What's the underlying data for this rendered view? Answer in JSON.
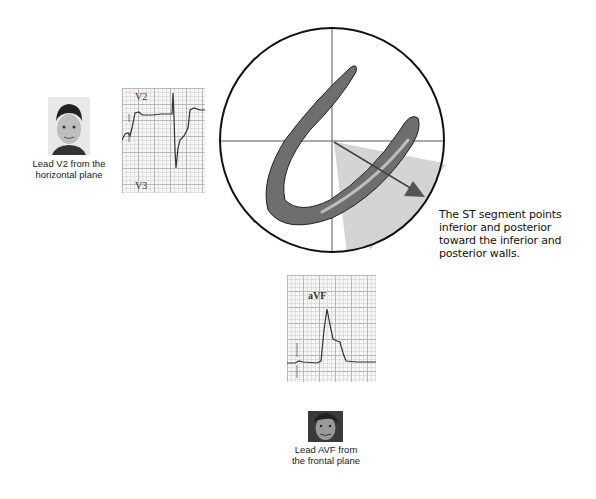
{
  "figure": {
    "left_panel": {
      "photo": "portrait-photo-boy",
      "caption_line1": "Lead V2 from the",
      "caption_line2": "horizontal plane",
      "ecg_top_label": "V2",
      "ecg_bottom_label": "V3"
    },
    "bottom_panel": {
      "ecg_label": "aVF",
      "photo": "portrait-photo-man",
      "caption_line1": "Lead AVF from",
      "caption_line2": "the frontal plane"
    },
    "annotation": {
      "line1": "The ST segment points",
      "line2": "inferior and posterior",
      "line3": "toward the inferior and",
      "line4": "posterior walls."
    },
    "colors": {
      "heart_shape": "#6e6e6e",
      "st_vector_cone": "#d4d4d4",
      "arrow": "#555555",
      "circle": "#111111"
    }
  }
}
